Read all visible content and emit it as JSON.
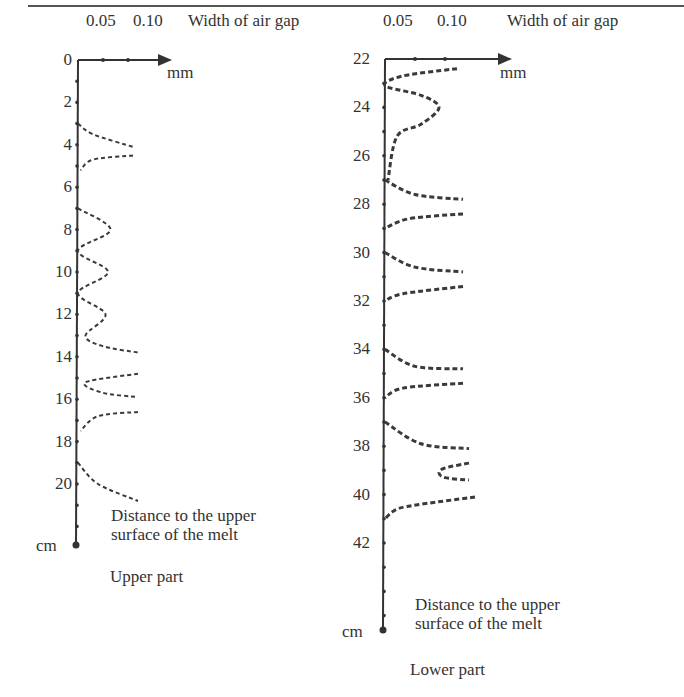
{
  "chart_data": [
    {
      "type": "line",
      "title": "Upper part",
      "xlabel": "Width of air gap",
      "xunit": "mm",
      "ylabel": "Distance to the upper surface of the melt",
      "yunit": "cm",
      "x_ticks": [
        "0.05",
        "0.10"
      ],
      "y_ticks": [
        "0",
        "2",
        "4",
        "6",
        "8",
        "10",
        "12",
        "14",
        "16",
        "18",
        "20"
      ],
      "xlim": [
        0,
        0.15
      ],
      "ylim": [
        0,
        22
      ],
      "y_inverted": true,
      "series": [
        {
          "name": "air gap segment 1",
          "points": [
            [
              0,
              3.0
            ],
            [
              0.03,
              3.5
            ],
            [
              0.11,
              4.1
            ]
          ]
        },
        {
          "name": "air gap segment 2",
          "points": [
            [
              0.11,
              4.5
            ],
            [
              0.03,
              4.7
            ],
            [
              0.005,
              5.2
            ]
          ]
        },
        {
          "name": "air gap segment 3",
          "points": [
            [
              0,
              7.0
            ],
            [
              0.065,
              8.0
            ],
            [
              0,
              9.0
            ],
            [
              0.06,
              10.0
            ],
            [
              0,
              11.0
            ],
            [
              0.055,
              12.0
            ],
            [
              0.015,
              13.0
            ],
            [
              0.05,
              13.5
            ],
            [
              0.12,
              13.8
            ]
          ]
        },
        {
          "name": "air gap segment 4",
          "points": [
            [
              0.12,
              14.8
            ],
            [
              0.015,
              15.2
            ],
            [
              0.05,
              15.7
            ],
            [
              0.12,
              15.9
            ]
          ]
        },
        {
          "name": "air gap segment 5",
          "points": [
            [
              0.12,
              16.6
            ],
            [
              0.04,
              16.8
            ],
            [
              0.005,
              17.5
            ]
          ]
        },
        {
          "name": "air gap segment 6",
          "points": [
            [
              0,
              19.0
            ],
            [
              0.04,
              20.0
            ],
            [
              0.12,
              20.8
            ]
          ]
        }
      ]
    },
    {
      "type": "line",
      "title": "Lower part",
      "xlabel": "Width of air gap",
      "xunit": "mm",
      "ylabel": "Distance to the upper surface of the melt",
      "yunit": "cm",
      "x_ticks": [
        "0.05",
        "0.10"
      ],
      "y_ticks": [
        "22",
        "24",
        "26",
        "28",
        "30",
        "32",
        "34",
        "36",
        "38",
        "40",
        "42"
      ],
      "xlim": [
        0,
        0.15
      ],
      "ylim": [
        22,
        45
      ],
      "y_inverted": true,
      "series": [
        {
          "name": "air gap segment 1",
          "points": [
            [
              0.12,
              22.4
            ],
            [
              0.03,
              22.7
            ],
            [
              0,
              23.1
            ],
            [
              0.06,
              23.5
            ],
            [
              0.09,
              24.0
            ],
            [
              0.06,
              24.7
            ],
            [
              0.02,
              25.2
            ],
            [
              0.005,
              27.0
            ]
          ]
        },
        {
          "name": "air gap segment 2",
          "points": [
            [
              0,
              27.0
            ],
            [
              0.05,
              27.6
            ],
            [
              0.13,
              27.8
            ]
          ]
        },
        {
          "name": "air gap segment 3",
          "points": [
            [
              0.13,
              28.4
            ],
            [
              0.04,
              28.6
            ],
            [
              0,
              29.0
            ]
          ]
        },
        {
          "name": "air gap segment 4",
          "points": [
            [
              0,
              30.0
            ],
            [
              0.05,
              30.6
            ],
            [
              0.13,
              30.8
            ]
          ]
        },
        {
          "name": "air gap segment 5",
          "points": [
            [
              0.13,
              31.4
            ],
            [
              0.03,
              31.7
            ],
            [
              0,
              32.0
            ]
          ]
        },
        {
          "name": "air gap segment 6",
          "points": [
            [
              0,
              34.0
            ],
            [
              0.05,
              34.7
            ],
            [
              0.13,
              34.8
            ]
          ]
        },
        {
          "name": "air gap segment 7",
          "points": [
            [
              0.13,
              35.4
            ],
            [
              0.03,
              35.6
            ],
            [
              0,
              36.0
            ]
          ]
        },
        {
          "name": "air gap segment 8",
          "points": [
            [
              0,
              37.0
            ],
            [
              0.06,
              37.9
            ],
            [
              0.14,
              38.1
            ]
          ]
        },
        {
          "name": "air gap segment 9",
          "points": [
            [
              0.14,
              38.7
            ],
            [
              0.1,
              38.9
            ],
            [
              0.09,
              39.1
            ],
            [
              0.1,
              39.3
            ],
            [
              0.14,
              39.4
            ]
          ]
        },
        {
          "name": "air gap segment 10",
          "points": [
            [
              0.15,
              40.1
            ],
            [
              0.06,
              40.4
            ],
            [
              0.02,
              40.6
            ],
            [
              0,
              41.0
            ]
          ]
        }
      ]
    }
  ],
  "top_rule": true,
  "left": {
    "x_ticks": [
      "0.05",
      "0.10"
    ],
    "xlabel": "Width of air gap",
    "xunit": "mm",
    "y_ticks": [
      "0",
      "2",
      "4",
      "6",
      "8",
      "10",
      "12",
      "14",
      "16",
      "18",
      "20"
    ],
    "yunit": "cm",
    "ylabel_line1": "Distance to the upper",
    "ylabel_line2": "surface of the melt",
    "caption": "Upper part"
  },
  "right": {
    "x_ticks": [
      "0.05",
      "0.10"
    ],
    "xlabel": "Width of air gap",
    "xunit": "mm",
    "y_ticks": [
      "22",
      "24",
      "26",
      "28",
      "30",
      "32",
      "34",
      "36",
      "38",
      "40",
      "42"
    ],
    "yunit": "cm",
    "ylabel_line1": "Distance to the upper",
    "ylabel_line2": "surface of the melt",
    "caption": "Lower part"
  },
  "colors": {
    "axis": "#333333",
    "curve": "#3a3a3a",
    "text": "#333333"
  }
}
